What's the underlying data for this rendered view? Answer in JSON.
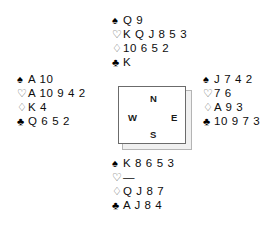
{
  "diagram": {
    "type": "bridge-deal",
    "suit_symbols": {
      "spades": "♠",
      "hearts": "♡",
      "diamonds": "♢",
      "clubs": "♣"
    },
    "compass": {
      "north": "N",
      "west": "W",
      "east": "E",
      "south": "S"
    },
    "hands": {
      "north": {
        "spades": "Q 9",
        "hearts": "K Q J 8 5 3",
        "diamonds": "10 6 5 2",
        "clubs": "K"
      },
      "west": {
        "spades": "A 10",
        "hearts": "A 10 9 4 2",
        "diamonds": "K 4",
        "clubs": "Q 6 5 2"
      },
      "east": {
        "spades": "J 7 4 2",
        "hearts": "7 6",
        "diamonds": "A 9 3",
        "clubs": "10 9 7 3"
      },
      "south": {
        "spades": "K 8 6 5 3",
        "hearts": "—",
        "diamonds": "Q J 8 7",
        "clubs": "A J 8 4"
      }
    }
  }
}
